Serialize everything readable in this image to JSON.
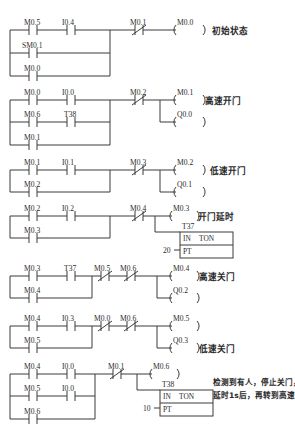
{
  "diagram": {
    "rail_x": 10,
    "colors": {
      "wire": "#3a3a3a",
      "text": "#2a2a2a",
      "background": "#ffffff"
    },
    "rungs": [
      {
        "id": "rung-1",
        "comment": "初始状态",
        "branches": [
          {
            "contacts": [
              {
                "label": "M0.5",
                "type": "no",
                "x": 32
              },
              {
                "label": "I0.4",
                "type": "no",
                "x": 70
              }
            ],
            "y": 30
          },
          {
            "contacts": [
              {
                "label": "SM0.1",
                "type": "no",
                "x": 32
              }
            ],
            "y": 53
          },
          {
            "contacts": [
              {
                "label": "M0.0",
                "type": "no",
                "x": 32
              }
            ],
            "y": 76
          }
        ],
        "series_after": [
          {
            "label": "M0.1",
            "type": "nc",
            "x": 138
          }
        ],
        "coils": [
          {
            "label": "M0.0",
            "x": 185,
            "y": 30
          }
        ]
      },
      {
        "id": "rung-2",
        "comment": "高速开门",
        "branches": [
          {
            "contacts": [
              {
                "label": "M0.0",
                "type": "no",
                "x": 32
              },
              {
                "label": "I0.0",
                "type": "no",
                "x": 70
              }
            ],
            "y": 100
          },
          {
            "contacts": [
              {
                "label": "M0.6",
                "type": "no",
                "x": 32
              },
              {
                "label": "T38",
                "type": "no",
                "x": 70
              }
            ],
            "y": 122
          },
          {
            "contacts": [
              {
                "label": "M0.1",
                "type": "no",
                "x": 32
              }
            ],
            "y": 145
          }
        ],
        "series_after": [
          {
            "label": "M0.2",
            "type": "nc",
            "x": 138
          }
        ],
        "coils": [
          {
            "label": "M0.1",
            "x": 185,
            "y": 100
          },
          {
            "label": "Q0.0",
            "x": 185,
            "y": 122
          }
        ]
      },
      {
        "id": "rung-3",
        "comment": "低速开门",
        "branches": [
          {
            "contacts": [
              {
                "label": "M0.1",
                "type": "no",
                "x": 32
              },
              {
                "label": "I0.1",
                "type": "no",
                "x": 70
              }
            ],
            "y": 170
          },
          {
            "contacts": [
              {
                "label": "M0.2",
                "type": "no",
                "x": 32
              }
            ],
            "y": 192
          }
        ],
        "series_after": [
          {
            "label": "M0.3",
            "type": "nc",
            "x": 138
          }
        ],
        "coils": [
          {
            "label": "M0.2",
            "x": 185,
            "y": 170
          },
          {
            "label": "Q0.1",
            "x": 185,
            "y": 192
          }
        ]
      },
      {
        "id": "rung-4",
        "comment": "开门延时",
        "branches": [
          {
            "contacts": [
              {
                "label": "M0.2",
                "type": "no",
                "x": 32
              },
              {
                "label": "I0.2",
                "type": "no",
                "x": 70
              }
            ],
            "y": 216
          },
          {
            "contacts": [
              {
                "label": "M0.3",
                "type": "no",
                "x": 32
              }
            ],
            "y": 238
          }
        ],
        "series_after": [
          {
            "label": "M0.4",
            "type": "nc",
            "x": 138
          }
        ],
        "coils": [
          {
            "label": "M0.3",
            "x": 185,
            "y": 216
          }
        ],
        "timer": {
          "name": "T37",
          "in_label": "IN",
          "type_label": "TON",
          "pt_label": "PT",
          "preset": "20",
          "x": 180,
          "y": 231
        }
      },
      {
        "id": "rung-5",
        "comment": "高速关门",
        "branches": [
          {
            "contacts": [
              {
                "label": "M0.3",
                "type": "no",
                "x": 32
              },
              {
                "label": "T37",
                "type": "no",
                "x": 70
              }
            ],
            "y": 276
          },
          {
            "contacts": [
              {
                "label": "M0.4",
                "type": "no",
                "x": 32
              }
            ],
            "y": 298
          }
        ],
        "series_after": [
          {
            "label": "M0.5",
            "type": "nc",
            "x": 113
          },
          {
            "label": "M0.6",
            "type": "nc",
            "x": 140
          }
        ],
        "coils": [
          {
            "label": "M0.4",
            "x": 185,
            "y": 276
          },
          {
            "label": "Q0.2",
            "x": 185,
            "y": 298
          }
        ]
      },
      {
        "id": "rung-6",
        "comment": "低速关门",
        "branches": [
          {
            "contacts": [
              {
                "label": "M0.4",
                "type": "no",
                "x": 32
              },
              {
                "label": "I0.3",
                "type": "no",
                "x": 70
              }
            ],
            "y": 326
          },
          {
            "contacts": [
              {
                "label": "M0.5",
                "type": "no",
                "x": 32
              }
            ],
            "y": 348
          }
        ],
        "series_after": [
          {
            "label": "M0.0",
            "type": "nc",
            "x": 113
          },
          {
            "label": "M0.6",
            "type": "nc",
            "x": 140
          }
        ],
        "coils": [
          {
            "label": "M0.5",
            "x": 185,
            "y": 326
          },
          {
            "label": "Q0.3",
            "x": 185,
            "y": 348
          }
        ]
      },
      {
        "id": "rung-7",
        "comment": "检测到有人，停止关门，",
        "comment2": "延时1s后，再转到高速开门",
        "branches": [
          {
            "contacts": [
              {
                "label": "M0.4",
                "type": "no",
                "x": 32
              },
              {
                "label": "I0.0",
                "type": "no",
                "x": 70
              }
            ],
            "y": 374
          },
          {
            "contacts": [
              {
                "label": "M0.5",
                "type": "no",
                "x": 32
              },
              {
                "label": "I0.0",
                "type": "no",
                "x": 70
              }
            ],
            "y": 396
          },
          {
            "contacts": [
              {
                "label": "M0.6",
                "type": "no",
                "x": 32
              }
            ],
            "y": 419
          }
        ],
        "series_after": [
          {
            "label": "M0.1",
            "type": "nc",
            "x": 116
          }
        ],
        "coils": [
          {
            "label": "M0.6",
            "x": 163,
            "y": 374
          }
        ],
        "timer": {
          "name": "T38",
          "in_label": "IN",
          "type_label": "TON",
          "pt_label": "PT",
          "preset": "10",
          "x": 160,
          "y": 389
        }
      }
    ]
  }
}
